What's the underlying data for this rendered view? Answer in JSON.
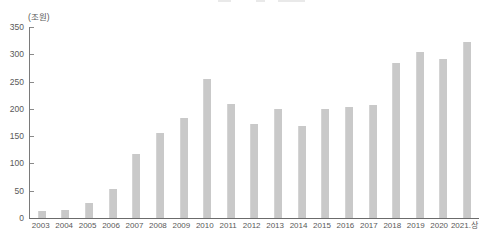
{
  "chart_data": {
    "type": "bar",
    "title": "",
    "unit_label": "(조원)",
    "categories": [
      "2003",
      "2004",
      "2005",
      "2006",
      "2007",
      "2008",
      "2009",
      "2010",
      "2011",
      "2012",
      "2013",
      "2014",
      "2015",
      "2016",
      "2017",
      "2018",
      "2019",
      "2020",
      "2021.상"
    ],
    "values": [
      13,
      15,
      27,
      54,
      118,
      155,
      184,
      254,
      209,
      173,
      199,
      168,
      200,
      204,
      207,
      284,
      305,
      291,
      323
    ],
    "xlabel": "",
    "ylabel": "(조원)",
    "ylim": [
      0,
      350
    ],
    "ytick_step": 50,
    "ytick_labels": [
      "0",
      "50",
      "100",
      "150",
      "200",
      "250",
      "300",
      "350"
    ],
    "grid": false,
    "legend_position": "none",
    "bar_color": "#c9c9c9",
    "axis_color": "#6b6b6b",
    "text_color": "#595959"
  }
}
